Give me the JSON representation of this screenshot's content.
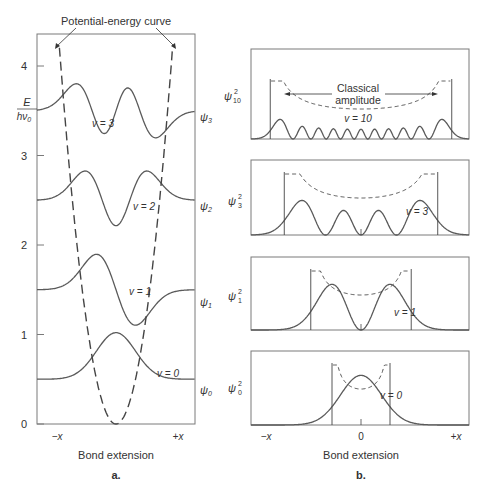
{
  "colors": {
    "stroke": "#5a5a5a",
    "frame": "#7a7a7a",
    "text": "#333333",
    "background": "#ffffff"
  },
  "panel_a": {
    "caption": "a.",
    "annotation": "Potential-energy curve",
    "ylabel_num": "E",
    "ylabel_den": "hν",
    "ylabel_den_sub": "0",
    "xlabel": "Bond extension",
    "x_left": "−x",
    "x_right": "+x",
    "yticks": [
      "0",
      "1",
      "2",
      "3",
      "4"
    ],
    "levels": [
      {
        "v_label": "v = 0",
        "psi": "ψ",
        "sub": "0"
      },
      {
        "v_label": "v = 1",
        "psi": "ψ",
        "sub": "1"
      },
      {
        "v_label": "v = 2",
        "psi": "ψ",
        "sub": "2"
      },
      {
        "v_label": "v = 3",
        "psi": "ψ",
        "sub": "3"
      }
    ]
  },
  "panel_b": {
    "caption": "b.",
    "xlabel": "Bond extension",
    "x_left": "−x",
    "x_center": "0",
    "x_right": "+x",
    "classical_label_1": "Classical",
    "classical_label_2": "amplitude",
    "panels": [
      {
        "psi": "ψ",
        "sup": "2",
        "sub": "10",
        "v_label": "v = 10"
      },
      {
        "psi": "ψ",
        "sup": "2",
        "sub": "3",
        "v_label": "v = 3"
      },
      {
        "psi": "ψ",
        "sup": "2",
        "sub": "1",
        "v_label": "v = 1"
      },
      {
        "psi": "ψ",
        "sup": "2",
        "sub": "0",
        "v_label": "v = 0"
      }
    ]
  },
  "chart_data": [
    {
      "type": "line",
      "title": "Harmonic oscillator wavefunctions in a potential-energy well",
      "xlabel": "Bond extension",
      "ylabel": "E / hν0",
      "ylim": [
        0,
        4.4
      ],
      "yticks": [
        0,
        1,
        2,
        3,
        4
      ],
      "series": [
        {
          "name": "Potential-energy curve",
          "style": "dashed",
          "shape": "parabola, vertex at E=0"
        },
        {
          "name": "ψ0",
          "v": 0,
          "baseline_E": 0.5,
          "nodes": 0
        },
        {
          "name": "ψ1",
          "v": 1,
          "baseline_E": 1.5,
          "nodes": 1
        },
        {
          "name": "ψ2",
          "v": 2,
          "baseline_E": 2.5,
          "nodes": 2
        },
        {
          "name": "ψ3",
          "v": 3,
          "baseline_E": 3.5,
          "nodes": 3
        }
      ]
    },
    {
      "type": "line",
      "title": "Probability densities ψ² versus classical probability",
      "xlabel": "Bond extension",
      "xticks": [
        "−x",
        "0",
        "+x"
      ],
      "series": [
        {
          "name": "ψ10²",
          "v": 10,
          "maxima": 11
        },
        {
          "name": "ψ3²",
          "v": 3,
          "maxima": 4
        },
        {
          "name": "ψ1²",
          "v": 1,
          "maxima": 2
        },
        {
          "name": "ψ0²",
          "v": 0,
          "maxima": 1
        }
      ],
      "annotations": [
        "Classical amplitude",
        "dashed = classical probability density"
      ]
    }
  ]
}
